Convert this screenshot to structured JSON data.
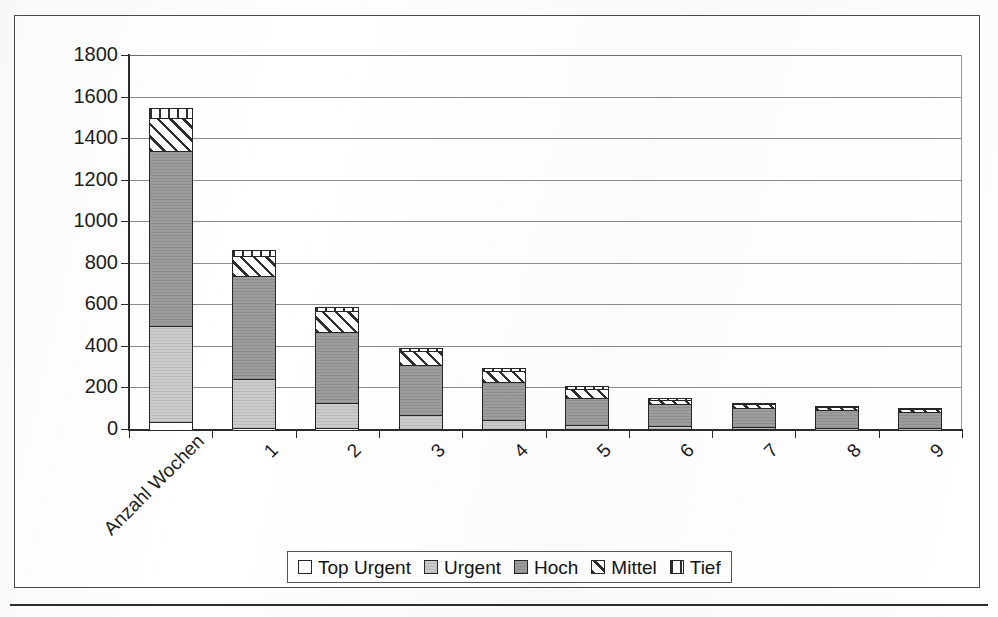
{
  "chart_data": {
    "type": "bar",
    "stacked": true,
    "title": "",
    "subtitle": "",
    "xlabel": "",
    "ylabel": "",
    "categories": [
      "Anzahl Wochen",
      "1",
      "2",
      "3",
      "4",
      "5",
      "6",
      "7",
      "8",
      "9"
    ],
    "series": [
      {
        "name": "Top Urgent",
        "values": [
          40,
          10,
          8,
          6,
          5,
          4,
          3,
          3,
          2,
          2
        ]
      },
      {
        "name": "Urgent",
        "values": [
          460,
          235,
          120,
          65,
          45,
          20,
          18,
          10,
          8,
          6
        ]
      },
      {
        "name": "Hoch",
        "values": [
          845,
          495,
          345,
          240,
          180,
          130,
          105,
          95,
          85,
          80
        ]
      },
      {
        "name": "Mittel",
        "values": [
          155,
          95,
          100,
          70,
          55,
          45,
          20,
          15,
          14,
          12
        ]
      },
      {
        "name": "Tief",
        "values": [
          45,
          25,
          15,
          10,
          8,
          6,
          5,
          4,
          4,
          3
        ]
      }
    ],
    "totals": [
      1545,
      860,
      588,
      391,
      293,
      205,
      151,
      127,
      113,
      103
    ],
    "ylim": [
      0,
      1800
    ],
    "ytick_step": 200,
    "yticks": [
      "1800",
      "1600",
      "1400",
      "1200",
      "1000",
      "800",
      "600",
      "400",
      "200",
      "0"
    ],
    "grid": true,
    "legend_position": "bottom",
    "xlabel_rotation": -45
  },
  "legend": {
    "items": [
      {
        "label": "Top Urgent",
        "fill": "topurgent"
      },
      {
        "label": "Urgent",
        "fill": "urgent"
      },
      {
        "label": "Hoch",
        "fill": "hoch"
      },
      {
        "label": "Mittel",
        "fill": "mittel"
      },
      {
        "label": "Tief",
        "fill": "tief"
      }
    ]
  },
  "colors": {
    "axis": "#2b2b2b",
    "grid": "#8d8d8d",
    "frame": "#4a4a4a",
    "urgent": "#cbcbcb",
    "hoch": "#9d9d9d",
    "topurgent": "#ffffff",
    "text": "#1c1c1c"
  }
}
